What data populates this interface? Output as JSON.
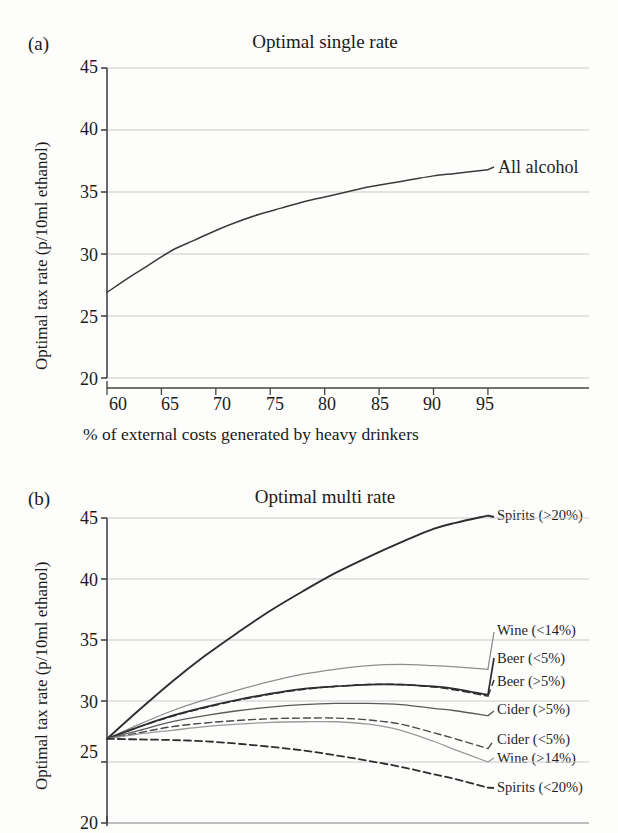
{
  "figure": {
    "panel_a_letter": "(a)",
    "panel_b_letter": "(b)"
  },
  "chart_data": [
    {
      "type": "line",
      "panel": "(a)",
      "title": "Optimal single rate",
      "xlabel": "% of external costs generated by heavy drinkers",
      "ylabel": "Optimal tax rate (p/10ml ethanol)",
      "xlim": [
        60,
        103
      ],
      "ylim": [
        20,
        45
      ],
      "xticks": [
        60,
        65,
        70,
        75,
        80,
        85,
        90,
        95
      ],
      "yticks": [
        20,
        25,
        30,
        35,
        40,
        45
      ],
      "grid": true,
      "legend_position": "inline-right",
      "x": [
        60,
        62,
        64,
        66,
        68,
        70,
        72,
        74,
        76,
        78,
        80,
        82,
        84,
        86,
        88,
        90,
        92,
        95
      ],
      "series": [
        {
          "name": "All alcohol",
          "style": "solid",
          "color": "#3b3b3b",
          "values": [
            26.9,
            28.1,
            29.2,
            30.3,
            31.1,
            31.9,
            32.6,
            33.2,
            33.7,
            34.2,
            34.6,
            35.0,
            35.4,
            35.7,
            36.0,
            36.3,
            36.5,
            36.8
          ]
        }
      ]
    },
    {
      "type": "line",
      "panel": "(b)",
      "title": "Optimal multi rate",
      "xlabel": "% of external costs generated by heavy drinkers",
      "ylabel": "Optimal tax rate (p/10ml ethanol)",
      "xlim": [
        60,
        103
      ],
      "ylim": [
        20,
        45
      ],
      "xticks": [
        60,
        65,
        70,
        75,
        80,
        85,
        90,
        95
      ],
      "yticks": [
        20,
        25,
        30,
        35,
        40,
        45
      ],
      "grid": true,
      "legend_position": "inline-right",
      "x": [
        60,
        63,
        66,
        69,
        72,
        75,
        78,
        81,
        84,
        87,
        90,
        92,
        95
      ],
      "series": [
        {
          "name": "Spirits (>20%)",
          "style": "solid",
          "color": "#2e2e2e",
          "width": 1.9,
          "values": [
            26.9,
            29.3,
            31.6,
            33.7,
            35.6,
            37.4,
            39.0,
            40.5,
            41.8,
            43.0,
            44.1,
            44.6,
            45.2
          ]
        },
        {
          "name": "Wine (<14%)",
          "style": "solid",
          "color": "#8e8e8e",
          "width": 1.3,
          "values": [
            26.9,
            28.1,
            29.2,
            30.1,
            30.9,
            31.6,
            32.2,
            32.6,
            32.9,
            33.0,
            32.9,
            32.8,
            32.6
          ]
        },
        {
          "name": "Beer (<5%)",
          "style": "solid",
          "color": "#2e2e2e",
          "width": 1.7,
          "values": [
            26.9,
            27.9,
            28.8,
            29.5,
            30.1,
            30.6,
            31.0,
            31.2,
            31.35,
            31.35,
            31.2,
            31.0,
            30.5
          ]
        },
        {
          "name": "Beer (>5%)",
          "style": "dashed",
          "color": "#2e2e2e",
          "width": 1.5,
          "values": [
            26.9,
            27.9,
            28.75,
            29.45,
            30.05,
            30.55,
            30.95,
            31.2,
            31.35,
            31.35,
            31.15,
            30.9,
            30.4
          ]
        },
        {
          "name": "Cider (>5%)",
          "style": "solid",
          "color": "#5a5a5a",
          "width": 1.3,
          "values": [
            26.9,
            27.6,
            28.3,
            28.8,
            29.2,
            29.5,
            29.7,
            29.8,
            29.8,
            29.7,
            29.4,
            29.2,
            28.8
          ]
        },
        {
          "name": "Cider (<5%)",
          "style": "dashed",
          "color": "#4a4a4a",
          "width": 1.4,
          "values": [
            26.9,
            27.4,
            27.9,
            28.2,
            28.4,
            28.55,
            28.6,
            28.6,
            28.45,
            28.1,
            27.4,
            26.9,
            26.1
          ]
        },
        {
          "name": "Wine (>14%)",
          "style": "solid",
          "color": "#9a9a9a",
          "width": 1.3,
          "values": [
            26.9,
            27.3,
            27.6,
            27.9,
            28.1,
            28.25,
            28.3,
            28.3,
            28.1,
            27.6,
            26.7,
            26.0,
            25.0
          ]
        },
        {
          "name": "Spirits (<20%)",
          "style": "dashed",
          "color": "#2e2e2e",
          "width": 1.8,
          "values": [
            26.9,
            26.85,
            26.8,
            26.7,
            26.5,
            26.25,
            25.95,
            25.55,
            25.1,
            24.6,
            24.0,
            23.6,
            22.9
          ]
        }
      ]
    }
  ]
}
